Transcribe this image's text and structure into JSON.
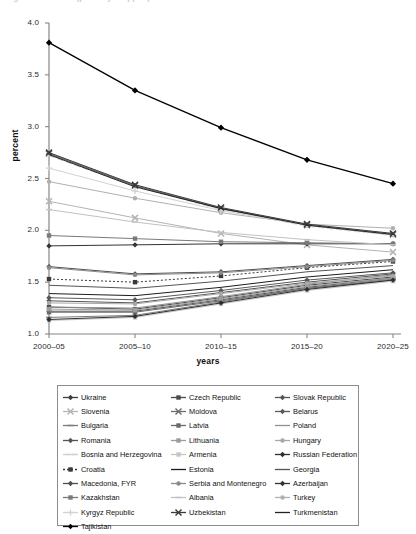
{
  "top_caption": "Figure continued (partially cropped)",
  "axes": {
    "ylabel": "percent",
    "xlabel": "years",
    "yticks": [
      "4.0",
      "3.5",
      "3.0",
      "2.5",
      "2.0",
      "1.5",
      "1.0"
    ],
    "xticks": [
      "2000–05",
      "2005–10",
      "2010–15",
      "2015–20",
      "2020–25"
    ]
  },
  "chart_data": {
    "type": "line",
    "title": "",
    "subtitle": "",
    "xlabel": "years",
    "ylabel": "percent",
    "ylim": [
      1.0,
      4.0
    ],
    "ytick_step": 0.5,
    "grid": false,
    "legend_position": "bottom",
    "legend_columns": 3,
    "categories": [
      "2000–05",
      "2005–10",
      "2010–15",
      "2015–20",
      "2020–25"
    ],
    "series": [
      {
        "name": "Ukraine",
        "marker": "diamond",
        "color": "#3f3f3f",
        "dash": "none",
        "values": [
          2.74,
          2.43,
          2.21,
          2.05,
          1.96
        ]
      },
      {
        "name": "Czech Republic",
        "marker": "square",
        "color": "#4a4a4a",
        "dash": "none",
        "values": [
          1.26,
          1.24,
          1.35,
          1.47,
          1.55
        ]
      },
      {
        "name": "Slovak Republic",
        "marker": "diamond",
        "color": "#565656",
        "dash": "none",
        "values": [
          1.22,
          1.22,
          1.33,
          1.45,
          1.54
        ]
      },
      {
        "name": "Slovenia",
        "marker": "x-cross",
        "color": "#b4b4b4",
        "dash": "none",
        "values": [
          2.28,
          2.12,
          1.97,
          1.86,
          1.79
        ]
      },
      {
        "name": "Moldova",
        "marker": "x-cross",
        "color": "#6e6e6e",
        "dash": "none",
        "values": [
          2.74,
          2.43,
          2.21,
          2.05,
          1.96
        ]
      },
      {
        "name": "Belarus",
        "marker": "diamond",
        "color": "#5a5a5a",
        "dash": "none",
        "values": [
          1.35,
          1.33,
          1.42,
          1.52,
          1.59
        ]
      },
      {
        "name": "Bulgaria",
        "marker": "dash",
        "color": "#7b7b7b",
        "dash": "none",
        "values": [
          1.16,
          1.18,
          1.31,
          1.44,
          1.53
        ]
      },
      {
        "name": "Latvia",
        "marker": "square",
        "color": "#6a6a6a",
        "dash": "none",
        "values": [
          1.21,
          1.21,
          1.32,
          1.44,
          1.52
        ]
      },
      {
        "name": "Poland",
        "marker": "none",
        "color": "#909090",
        "dash": "none",
        "values": [
          1.26,
          1.25,
          1.36,
          1.48,
          1.57
        ]
      },
      {
        "name": "Romania",
        "marker": "diamond",
        "color": "#555555",
        "dash": "none",
        "values": [
          1.32,
          1.3,
          1.4,
          1.5,
          1.58
        ]
      },
      {
        "name": "Lithuania",
        "marker": "square",
        "color": "#9c9c9c",
        "dash": "none",
        "values": [
          1.24,
          1.23,
          1.34,
          1.46,
          1.54
        ]
      },
      {
        "name": "Hungary",
        "marker": "circle",
        "color": "#a8a8a8",
        "dash": "none",
        "values": [
          1.3,
          1.29,
          1.39,
          1.49,
          1.56
        ]
      },
      {
        "name": "Bosnia and Herzegovina",
        "marker": "dash",
        "color": "#cfcfcf",
        "dash": "dash",
        "values": [
          2.72,
          2.42,
          2.2,
          2.04,
          1.95
        ]
      },
      {
        "name": "Armenia",
        "marker": "square",
        "color": "#c6c6c6",
        "dash": "none",
        "values": [
          1.13,
          1.16,
          1.29,
          1.42,
          1.51
        ]
      },
      {
        "name": "Russian Federation",
        "marker": "diamond",
        "color": "#2e2e2e",
        "dash": "none",
        "values": [
          1.14,
          1.17,
          1.3,
          1.43,
          1.52
        ]
      },
      {
        "name": "Croatia",
        "marker": "square",
        "color": "#3b3b3b",
        "dash": "dot",
        "values": [
          1.53,
          1.5,
          1.56,
          1.64,
          1.7
        ]
      },
      {
        "name": "Estonia",
        "marker": "none",
        "color": "#1c1c1c",
        "dash": "none",
        "values": [
          1.39,
          1.37,
          1.45,
          1.55,
          1.62
        ]
      },
      {
        "name": "Georgia",
        "marker": "none",
        "color": "#555555",
        "dash": "none",
        "values": [
          1.47,
          1.44,
          1.51,
          1.6,
          1.66
        ]
      },
      {
        "name": "Macedonia, FYR",
        "marker": "diamond",
        "color": "#4f4f4f",
        "dash": "none",
        "values": [
          1.65,
          1.58,
          1.6,
          1.66,
          1.72
        ]
      },
      {
        "name": "Serbia and Montenegro",
        "marker": "circle",
        "color": "#8a8a8a",
        "dash": "none",
        "values": [
          1.64,
          1.57,
          1.59,
          1.65,
          1.71
        ]
      },
      {
        "name": "Azerbaijan",
        "marker": "diamond",
        "color": "#333333",
        "dash": "none",
        "values": [
          1.85,
          1.86,
          1.87,
          1.87,
          1.87
        ]
      },
      {
        "name": "Kazakhstan",
        "marker": "square",
        "color": "#7a7a7a",
        "dash": "none",
        "values": [
          1.95,
          1.92,
          1.89,
          1.88,
          1.87
        ]
      },
      {
        "name": "Albania",
        "marker": "dash",
        "color": "#c2c2c2",
        "dash": "none",
        "values": [
          2.2,
          2.08,
          1.98,
          1.91,
          1.86
        ]
      },
      {
        "name": "Turkey",
        "marker": "circle",
        "color": "#b0b0b0",
        "dash": "none",
        "values": [
          2.47,
          2.31,
          2.17,
          2.06,
          2.02
        ]
      },
      {
        "name": "Kyrgyz Republic",
        "marker": "plus",
        "color": "#d2d2d2",
        "dash": "none",
        "values": [
          2.6,
          2.38,
          2.19,
          2.05,
          1.96
        ]
      },
      {
        "name": "Uzbekistan",
        "marker": "x-cross",
        "color": "#3a3a3a",
        "dash": "none",
        "values": [
          2.75,
          2.44,
          2.22,
          2.06,
          1.97
        ]
      },
      {
        "name": "Turkmenistan",
        "marker": "none",
        "color": "#232323",
        "dash": "none",
        "values": [
          2.73,
          2.42,
          2.21,
          2.05,
          1.96
        ]
      },
      {
        "name": "Tajikistan",
        "marker": "diamond",
        "color": "#000000",
        "dash": "none",
        "values": [
          3.81,
          3.35,
          2.99,
          2.68,
          2.45
        ]
      }
    ]
  },
  "legend": {
    "columns": [
      [
        {
          "label": "Ukraine",
          "marker": "diamond",
          "color": "#3f3f3f",
          "dash": "none"
        },
        {
          "label": "Slovenia",
          "marker": "x-cross",
          "color": "#b4b4b4",
          "dash": "none"
        },
        {
          "label": "Bulgaria",
          "marker": "dash",
          "color": "#7b7b7b",
          "dash": "none"
        },
        {
          "label": "Romania",
          "marker": "diamond",
          "color": "#555555",
          "dash": "none"
        },
        {
          "label": "Bosnia and Herzegovina",
          "marker": "dash",
          "color": "#cfcfcf",
          "dash": "dash"
        },
        {
          "label": "Croatia",
          "marker": "square",
          "color": "#3b3b3b",
          "dash": "dot"
        },
        {
          "label": "Macedonia, FYR",
          "marker": "diamond",
          "color": "#4f4f4f",
          "dash": "none"
        },
        {
          "label": "Kazakhstan",
          "marker": "square",
          "color": "#7a7a7a",
          "dash": "none"
        },
        {
          "label": "Kyrgyz Republic",
          "marker": "plus",
          "color": "#d2d2d2",
          "dash": "none"
        },
        {
          "label": "Tajikistan",
          "marker": "diamond",
          "color": "#000000",
          "dash": "none"
        }
      ],
      [
        {
          "label": "Czech Republic",
          "marker": "square",
          "color": "#4a4a4a",
          "dash": "none"
        },
        {
          "label": "Moldova",
          "marker": "x-cross",
          "color": "#6e6e6e",
          "dash": "none"
        },
        {
          "label": "Latvia",
          "marker": "square",
          "color": "#6a6a6a",
          "dash": "none"
        },
        {
          "label": "Lithuania",
          "marker": "square",
          "color": "#9c9c9c",
          "dash": "none"
        },
        {
          "label": "Armenia",
          "marker": "square",
          "color": "#c6c6c6",
          "dash": "none"
        },
        {
          "label": "Estonia",
          "marker": "none",
          "color": "#1c1c1c",
          "dash": "none"
        },
        {
          "label": "Serbia and Montenegro",
          "marker": "circle",
          "color": "#8a8a8a",
          "dash": "none"
        },
        {
          "label": "Albania",
          "marker": "dash",
          "color": "#c2c2c2",
          "dash": "none"
        },
        {
          "label": "Uzbekistan",
          "marker": "x-cross",
          "color": "#3a3a3a",
          "dash": "none"
        }
      ],
      [
        {
          "label": "Slovak Republic",
          "marker": "diamond",
          "color": "#565656",
          "dash": "none"
        },
        {
          "label": "Belarus",
          "marker": "diamond",
          "color": "#5a5a5a",
          "dash": "none"
        },
        {
          "label": "Poland",
          "marker": "none",
          "color": "#909090",
          "dash": "none"
        },
        {
          "label": "Hungary",
          "marker": "circle",
          "color": "#a8a8a8",
          "dash": "none"
        },
        {
          "label": "Russian Federation",
          "marker": "diamond",
          "color": "#2e2e2e",
          "dash": "none"
        },
        {
          "label": "Georgia",
          "marker": "none",
          "color": "#555555",
          "dash": "none"
        },
        {
          "label": "Azerbaijan",
          "marker": "diamond",
          "color": "#333333",
          "dash": "none"
        },
        {
          "label": "Turkey",
          "marker": "circle",
          "color": "#b0b0b0",
          "dash": "none"
        },
        {
          "label": "Turkmenistan",
          "marker": "none",
          "color": "#232323",
          "dash": "none"
        }
      ]
    ]
  }
}
